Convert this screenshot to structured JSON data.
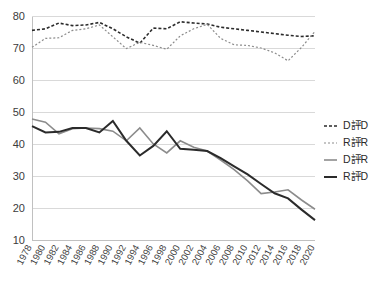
{
  "chart_data": {
    "type": "line",
    "title": "",
    "subtitle": "",
    "xlabel": "",
    "ylabel": "",
    "xlim": [
      1978,
      2020
    ],
    "ylim": [
      10,
      80
    ],
    "yticks": [
      10,
      20,
      30,
      40,
      50,
      60,
      70,
      80
    ],
    "grid": true,
    "legend_position": "right",
    "categories": [
      1978,
      1980,
      1982,
      1984,
      1986,
      1988,
      1990,
      1992,
      1994,
      1996,
      1998,
      2000,
      2002,
      2004,
      2006,
      2008,
      2010,
      2012,
      2014,
      2016,
      2018,
      2020
    ],
    "xtick_labels": [
      "1978",
      "1980",
      "1982",
      "1984",
      "1986",
      "1988",
      "1990",
      "1992",
      "1994",
      "1996",
      "1998",
      "2000",
      "2002",
      "2004",
      "2006",
      "2008",
      "2010",
      "2012",
      "2014",
      "2016",
      "2018",
      "2020"
    ],
    "ytick_labels": [
      "10",
      "20",
      "30",
      "40",
      "50",
      "60",
      "70",
      "80"
    ],
    "series": [
      {
        "name": "D評D",
        "style": "dashed-dark",
        "color": "#2b2b2b",
        "dash": "3,2",
        "width": 1.6,
        "values": [
          75.5,
          76.0,
          77.8,
          77.0,
          77.2,
          78.0,
          76.0,
          73.5,
          71.5,
          76.2,
          76.0,
          78.2,
          77.8,
          77.5,
          76.5,
          76.0,
          75.5,
          75.0,
          74.5,
          74.0,
          73.6,
          73.8
        ]
      },
      {
        "name": "R評R",
        "style": "dashed-light",
        "color": "#8c8c8c",
        "dash": "2,2",
        "width": 1.2,
        "values": [
          70.2,
          73.0,
          73.2,
          75.5,
          76.0,
          77.2,
          73.5,
          69.8,
          71.8,
          70.8,
          69.6,
          73.8,
          76.0,
          77.4,
          73.0,
          71.0,
          70.8,
          70.0,
          68.5,
          66.0,
          70.2,
          75.2
        ]
      },
      {
        "name": "D評R",
        "style": "solid-light",
        "color": "#8c8c8c",
        "dash": "",
        "width": 1.6,
        "values": [
          47.8,
          46.8,
          43.2,
          44.8,
          45.0,
          44.8,
          44.0,
          41.0,
          45.0,
          40.0,
          37.2,
          41.0,
          39.0,
          37.8,
          35.0,
          32.0,
          28.5,
          24.5,
          25.0,
          25.7,
          22.5,
          19.6
        ]
      },
      {
        "name": "R評D",
        "style": "solid-dark",
        "color": "#2b2b2b",
        "dash": "",
        "width": 2.0,
        "values": [
          45.6,
          43.6,
          43.8,
          45.0,
          45.0,
          43.6,
          47.2,
          41.0,
          36.4,
          39.4,
          44.0,
          38.5,
          38.2,
          37.8,
          35.6,
          33.0,
          30.5,
          27.5,
          24.6,
          23.0,
          19.5,
          16.2
        ]
      }
    ],
    "legend": [
      {
        "label": "D評D",
        "style": "dashed-dark",
        "color": "#2b2b2b",
        "dash": "3,2",
        "width": 1.6
      },
      {
        "label": "R評R",
        "style": "dashed-light",
        "color": "#8c8c8c",
        "dash": "2,2",
        "width": 1.2
      },
      {
        "label": "D評R",
        "style": "solid-light",
        "color": "#8c8c8c",
        "dash": "",
        "width": 1.6
      },
      {
        "label": "R評D",
        "style": "solid-dark",
        "color": "#2b2b2b",
        "dash": "",
        "width": 2.0
      }
    ],
    "colors": {
      "grid": "#d9d9d9",
      "axis": "#c0c0c0",
      "text": "#3b3b3b",
      "dark_series": "#2b2b2b",
      "light_series": "#8c8c8c",
      "background": "#ffffff"
    }
  }
}
